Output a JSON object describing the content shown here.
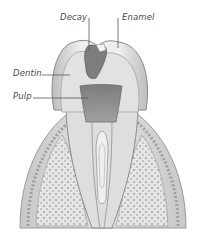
{
  "figure": {
    "labels": [
      {
        "id": "decay",
        "text": "Decay"
      },
      {
        "id": "enamel",
        "text": "Enamel"
      },
      {
        "id": "dentin",
        "text": "Dentin"
      },
      {
        "id": "pulp",
        "text": "Pulp"
      }
    ]
  },
  "colors": {
    "background": "#ffffff",
    "enamel": "#e9e9e9",
    "dentin": "#dcdcdc",
    "pulp": "#8a8a8a",
    "decay": "#7a7a7a",
    "gum": "#d2d2d2",
    "bone": "#e4e4e4",
    "outline": "#8c8c8c",
    "leader_line": "#555555"
  }
}
